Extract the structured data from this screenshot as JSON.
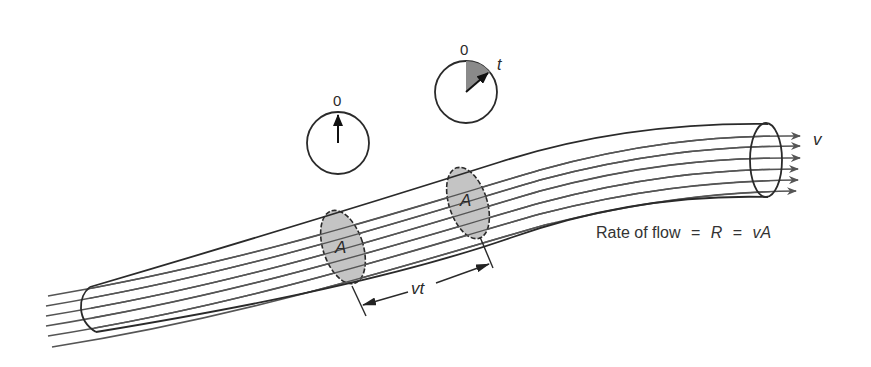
{
  "diagram": {
    "equation": {
      "prefix": "Rate of flow",
      "eq1": "=",
      "symbol_R": "R",
      "eq2": "=",
      "symbol_vA": "vA"
    },
    "labels": {
      "area_left": "A",
      "area_right": "A",
      "distance": "vt",
      "velocity": "v",
      "clock_left_zero": "0",
      "clock_right_zero": "0",
      "clock_right_time": "t"
    },
    "colors": {
      "line": "#2a2a2a",
      "streamline": "#555555",
      "cross_section_fill": "#c4c4c4",
      "clock_wedge_fill": "#8a8a8a"
    }
  }
}
